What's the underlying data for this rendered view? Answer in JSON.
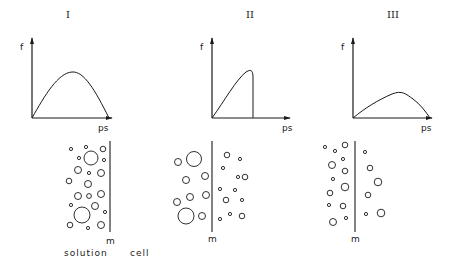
{
  "panels": [
    {
      "numeral": "I",
      "y_label": "f",
      "x_label": "ps",
      "membrane_label": "m",
      "curve": "broad symmetric hump"
    },
    {
      "numeral": "II",
      "y_label": "f",
      "x_label": "ps",
      "membrane_label": "m",
      "curve": "rising then sharp cutoff"
    },
    {
      "numeral": "III",
      "y_label": "f",
      "x_label": "ps",
      "membrane_label": "m",
      "curve": "low flat hump"
    }
  ],
  "bottom_labels": {
    "solution": "solution",
    "cell": "cell"
  },
  "colors": {
    "ink": "#1a1a1a",
    "background": "#ffffff"
  }
}
